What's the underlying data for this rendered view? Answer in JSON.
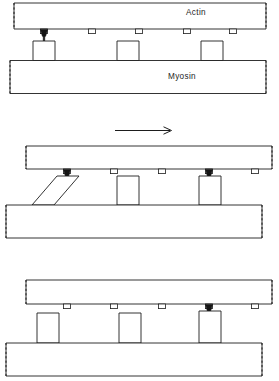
{
  "figure": {
    "stroke_color": "#1d1d1d",
    "attachment_color": "#141414",
    "background": "#ffffff"
  },
  "labels": {
    "actin": "Actin",
    "myosin": "Myosin"
  },
  "panels": [
    {
      "id": "panel-top",
      "stage_index": "1",
      "actin": {
        "label": "Actin",
        "label_shown": true,
        "x": 14,
        "y": 3,
        "width": 252,
        "height": 26,
        "left_end": "dashed",
        "right_end": "dashed"
      },
      "myosin": {
        "label": "Myosin",
        "label_shown": true,
        "x": 10,
        "y": 60,
        "width": 256,
        "height": 33,
        "left_end": "dashed",
        "right_end": "dashed"
      },
      "binding_sites": [
        {
          "x": 44,
          "attached": true
        },
        {
          "x": 92,
          "attached": false
        },
        {
          "x": 139,
          "attached": false
        },
        {
          "x": 187,
          "attached": false
        },
        {
          "x": 233,
          "attached": false
        }
      ],
      "cross_bridges": [
        {
          "x": 35,
          "width": 22,
          "tilt": "upright",
          "attached": true
        },
        {
          "x": 118,
          "width": 22,
          "tilt": "upright",
          "attached": false
        },
        {
          "x": 202,
          "width": 22,
          "tilt": "upright",
          "attached": false
        }
      ],
      "arrow": null
    },
    {
      "id": "panel-middle",
      "stage_index": "2",
      "actin": {
        "label": "",
        "label_shown": false,
        "x": 26,
        "y": 146,
        "width": 246,
        "height": 23,
        "left_end": "dashed",
        "right_end": "dashed"
      },
      "myosin": {
        "label": "",
        "label_shown": false,
        "x": 6,
        "y": 205,
        "width": 256,
        "height": 33,
        "left_end": "dashed",
        "right_end": "dashed"
      },
      "binding_sites": [
        {
          "x": 67,
          "attached": true
        },
        {
          "x": 114,
          "attached": false
        },
        {
          "x": 162,
          "attached": false
        },
        {
          "x": 209,
          "attached": true
        },
        {
          "x": 255,
          "attached": false
        }
      ],
      "cross_bridges": [
        {
          "x": 32,
          "width": 22,
          "tilt": "tilted",
          "attached": true
        },
        {
          "x": 118,
          "width": 22,
          "tilt": "upright",
          "attached": false
        },
        {
          "x": 200,
          "width": 22,
          "tilt": "upright",
          "attached": true
        }
      ],
      "arrow": {
        "x1": 115,
        "x2": 172,
        "y": 130,
        "direction": "right"
      }
    },
    {
      "id": "panel-bottom",
      "stage_index": "3",
      "actin": {
        "label": "",
        "label_shown": false,
        "x": 26,
        "y": 280,
        "width": 246,
        "height": 24,
        "left_end": "dashed",
        "right_end": "dashed"
      },
      "myosin": {
        "label": "",
        "label_shown": false,
        "x": 6,
        "y": 343,
        "width": 256,
        "height": 33,
        "left_end": "dashed",
        "right_end": "dashed"
      },
      "binding_sites": [
        {
          "x": 67,
          "attached": false
        },
        {
          "x": 114,
          "attached": false
        },
        {
          "x": 162,
          "attached": false
        },
        {
          "x": 209,
          "attached": true
        },
        {
          "x": 255,
          "attached": false
        }
      ],
      "cross_bridges": [
        {
          "x": 38,
          "width": 22,
          "tilt": "upright",
          "attached": false
        },
        {
          "x": 120,
          "width": 22,
          "tilt": "upright",
          "attached": false
        },
        {
          "x": 200,
          "width": 22,
          "tilt": "upright",
          "attached": true
        }
      ],
      "arrow": null
    }
  ]
}
